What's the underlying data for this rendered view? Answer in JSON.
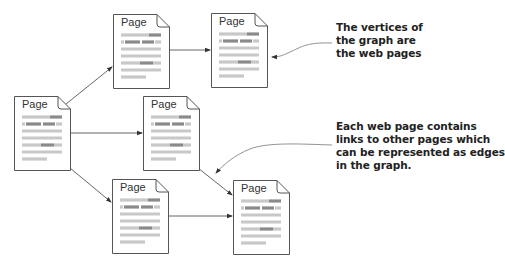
{
  "diagram": {
    "nodes": [
      {
        "id": "p0",
        "label": "Page",
        "x": 14,
        "y": 96
      },
      {
        "id": "p1",
        "label": "Page",
        "x": 113,
        "y": 14
      },
      {
        "id": "p2",
        "label": "Page",
        "x": 211,
        "y": 13
      },
      {
        "id": "p3",
        "label": "Page",
        "x": 143,
        "y": 96
      },
      {
        "id": "p4",
        "label": "Page",
        "x": 112,
        "y": 179
      },
      {
        "id": "p5",
        "label": "Page",
        "x": 233,
        "y": 180
      }
    ],
    "edges": [
      {
        "from": "p0",
        "to": "p1"
      },
      {
        "from": "p0",
        "to": "p3"
      },
      {
        "from": "p0",
        "to": "p4"
      },
      {
        "from": "p1",
        "to": "p2"
      },
      {
        "from": "p3",
        "to": "p5"
      },
      {
        "from": "p4",
        "to": "p5"
      }
    ],
    "annotations": [
      {
        "id": "vertices-note",
        "text": "The vertices of\nthe graph are\nthe web pages",
        "points_to": "p2"
      },
      {
        "id": "edges-note",
        "text": "Each web page contains\nlinks to other pages which\ncan be represented as edges\nin the graph.",
        "points_to": "p3-p5 edge"
      }
    ],
    "colors": {
      "outline": "#555555",
      "line_light": "#c8c8c8",
      "line_dark": "#8a8a8a",
      "arrow": "#444444",
      "text": "#222222"
    }
  }
}
